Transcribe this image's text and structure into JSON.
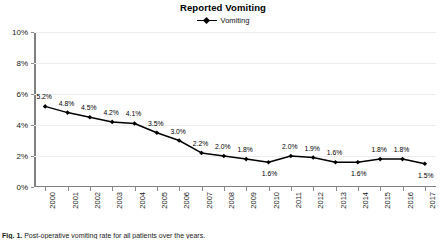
{
  "chart_data": {
    "type": "line",
    "title": "Reported Vomiting",
    "xlabel": "",
    "ylabel": "",
    "ylim": [
      0,
      10
    ],
    "ytick_labels": [
      "0%",
      "2%",
      "4%",
      "6%",
      "8%",
      "10%"
    ],
    "ytick_values": [
      0,
      2,
      4,
      6,
      8,
      10
    ],
    "grid": true,
    "legend_position": "top-center",
    "legend": [
      "Vomiting"
    ],
    "categories": [
      "2000",
      "2001",
      "2002",
      "2003",
      "2004",
      "2005",
      "2006",
      "2007",
      "2008",
      "2009",
      "2010",
      "2011",
      "2012",
      "2013",
      "2014",
      "2015",
      "2016",
      "2017"
    ],
    "series": [
      {
        "name": "Vomiting",
        "color": "#000000",
        "values": [
          5.2,
          4.8,
          4.5,
          4.2,
          4.1,
          3.5,
          3.0,
          2.2,
          2.0,
          1.8,
          1.6,
          2.0,
          1.9,
          1.6,
          1.6,
          1.8,
          1.8,
          1.5
        ],
        "data_labels": [
          "5.2%",
          "4.8%",
          "4.5%",
          "4.2%",
          "4.1%",
          "3.5%",
          "3.0%",
          "2.2%",
          "2.0%",
          "1.8%",
          "1.6%",
          "2.0%",
          "1.9%",
          "1.6%",
          "1.6%",
          "1.8%",
          "1.8%",
          "1.5%"
        ],
        "label_positions": [
          "above",
          "above",
          "above",
          "above",
          "above",
          "above",
          "above",
          "above",
          "above",
          "above",
          "below",
          "above",
          "above",
          "above",
          "below",
          "above",
          "above",
          "below"
        ]
      }
    ]
  },
  "caption": {
    "label": "Fig. 1.",
    "text": " Post-operative vomiting rate for all patients over the years."
  },
  "colors": {
    "series": "#000000",
    "gridline": "#ededed",
    "axis": "#808080",
    "text": "#1a1a1a"
  }
}
